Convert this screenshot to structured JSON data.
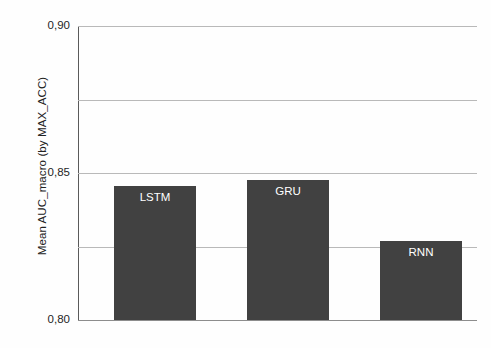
{
  "chart_data": {
    "type": "bar",
    "title": "",
    "subtitle": "",
    "xlabel": "",
    "ylabel": "Mean AUC_macro (by MAX_ACC)",
    "categories": [
      "LSTM",
      "GRU",
      "RNN"
    ],
    "values": [
      0.791,
      0.795,
      0.754
    ],
    "value_labels": [
      "LSTM",
      "GRU",
      "RNN"
    ],
    "ylim": [
      0.7,
      0.9
    ],
    "ytick_values": [
      0.9,
      0.85,
      0.8,
      0.75,
      0.7
    ],
    "ytick_labels": [
      "0,90",
      "0,85",
      "0,80",
      "0,75",
      "0,70"
    ],
    "decimal_separator": ",",
    "grid": "horizontal",
    "legend": "none",
    "bar_color": "#414141",
    "bar_label_color": "#ffffff",
    "gridline_color": "#b9b9b9",
    "axis_color": "#5a5a5a",
    "background_color": "#fefefe",
    "bar_label_position": "inside-top"
  }
}
